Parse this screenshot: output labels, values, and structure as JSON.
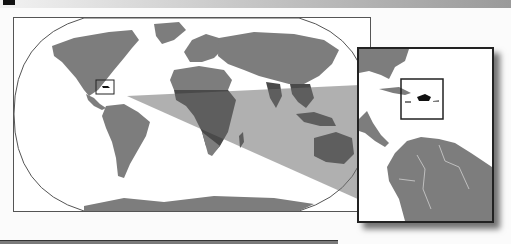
{
  "map": {
    "type": "locator-map",
    "projection": "Robinson (elliptical world outline)",
    "highlighted_region": "Hispaniola (Caribbean)",
    "colors": {
      "land": "#7d7d7d",
      "land_dark": "#4a4a4a",
      "ocean": "#ffffff",
      "callout": "#8a8a8a",
      "highlight": "#111111",
      "frame": "#333333"
    },
    "world_panel": {
      "label": "World overview map"
    },
    "inset_panel": {
      "label": "Caribbean inset map"
    },
    "locator_box": {
      "label": "Location box"
    }
  }
}
